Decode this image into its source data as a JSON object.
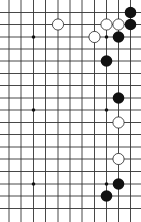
{
  "board": {
    "background": "#ffffff",
    "line_color": "#333333",
    "columns_x": [
      9,
      21,
      33.5,
      45.5,
      58,
      70,
      82,
      94.5,
      106.5,
      118.5,
      130.5
    ],
    "rows_y": [
      12.5,
      24.5,
      37,
      49,
      61,
      73.5,
      85.5,
      98,
      110,
      122.5,
      134.5,
      147,
      159,
      171.5,
      184,
      196,
      208.5
    ],
    "star_points": [
      {
        "col": 2,
        "row": 2
      },
      {
        "col": 8,
        "row": 2
      },
      {
        "col": 2,
        "row": 8
      },
      {
        "col": 8,
        "row": 8
      },
      {
        "col": 2,
        "row": 14
      },
      {
        "col": 8,
        "row": 14
      }
    ],
    "stones": [
      {
        "color": "black",
        "col": 10,
        "row": 0
      },
      {
        "color": "black",
        "col": 10,
        "row": 1
      },
      {
        "color": "white",
        "col": 4,
        "row": 1
      },
      {
        "color": "white",
        "col": 8,
        "row": 1
      },
      {
        "color": "white",
        "col": 9,
        "row": 1
      },
      {
        "color": "white",
        "col": 7,
        "row": 2
      },
      {
        "color": "black",
        "col": 9,
        "row": 2
      },
      {
        "color": "black",
        "col": 8,
        "row": 4
      },
      {
        "color": "black",
        "col": 9,
        "row": 7
      },
      {
        "color": "white",
        "col": 9,
        "row": 9
      },
      {
        "color": "white",
        "col": 9,
        "row": 12
      },
      {
        "color": "black",
        "col": 9,
        "row": 14
      },
      {
        "color": "black",
        "col": 8,
        "row": 15
      }
    ],
    "stone_colors": {
      "black": "#111111",
      "white": "#ffffff"
    }
  }
}
